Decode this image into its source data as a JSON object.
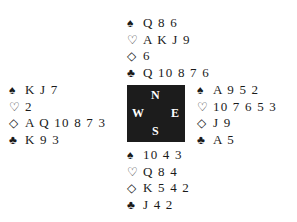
{
  "suits": {
    "spade": "♠",
    "heart": "♡",
    "diamond": "◇",
    "club": "♣"
  },
  "compass": {
    "north": "N",
    "south": "S",
    "west": "W",
    "east": "E"
  },
  "hands": {
    "north": {
      "spades": "Q 8 6",
      "hearts": "A K J 9",
      "diamonds": "6",
      "clubs": "Q 10 8 7 6"
    },
    "west": {
      "spades": "K J 7",
      "hearts": "2",
      "diamonds": "A Q 10 8 7 3",
      "clubs": "K 9 3"
    },
    "east": {
      "spades": "A 9 5 2",
      "hearts": "10 7 6 5 3",
      "diamonds": "J 9",
      "clubs": "A 5"
    },
    "south": {
      "spades": "10 4 3",
      "hearts": "Q 8 4",
      "diamonds": "K 5 4 2",
      "clubs": "J 4 2"
    }
  }
}
